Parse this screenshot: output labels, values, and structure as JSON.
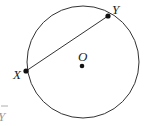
{
  "diagram": {
    "type": "circle-chord",
    "center": {
      "label": "O",
      "x": 82,
      "y": 66
    },
    "circle": {
      "cx": 83,
      "cy": 62,
      "r": 56
    },
    "points": [
      {
        "label": "X",
        "x": 26,
        "y": 71
      },
      {
        "label": "Y",
        "x": 108,
        "y": 16
      }
    ],
    "chord": {
      "from": "X",
      "to": "Y"
    },
    "partial_label": "Y",
    "colors": {
      "stroke": "#333333",
      "background": "#ffffff"
    }
  }
}
